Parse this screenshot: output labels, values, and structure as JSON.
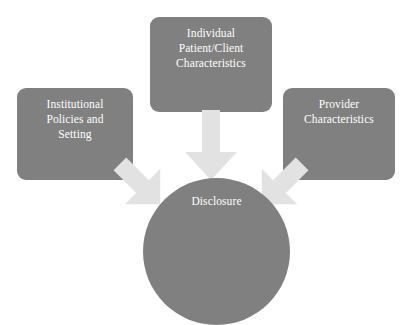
{
  "diagram": {
    "background_color": "#ffffff",
    "node_fill_color": "#808080",
    "node_text_color": "#ffffff",
    "arrow_color": "#e2e2e2",
    "nodes": [
      {
        "id": "individual",
        "shape": "rounded-rectangle",
        "label": "Individual Patient/Client Characteristics",
        "lines": [
          "Individual",
          "Patient/Client",
          "Characteristics"
        ]
      },
      {
        "id": "institutional",
        "shape": "rounded-rectangle",
        "label": "Institutional Policies and Setting",
        "lines": [
          "Institutional",
          "Policies and",
          "Setting"
        ]
      },
      {
        "id": "provider",
        "shape": "rounded-rectangle",
        "label": "Provider Characteristics",
        "lines": [
          "Provider",
          "Characteristics"
        ]
      },
      {
        "id": "disclosure",
        "shape": "circle",
        "label": "Disclosure",
        "lines": [
          "Disclosure"
        ]
      }
    ],
    "arrows": [
      {
        "id": "individual-to-disclosure",
        "from": "individual",
        "to": "disclosure",
        "direction": "down"
      },
      {
        "id": "institutional-to-disclosure",
        "from": "institutional",
        "to": "disclosure",
        "direction": "down-right"
      },
      {
        "id": "provider-to-disclosure",
        "from": "provider",
        "to": "disclosure",
        "direction": "down-left"
      }
    ]
  }
}
